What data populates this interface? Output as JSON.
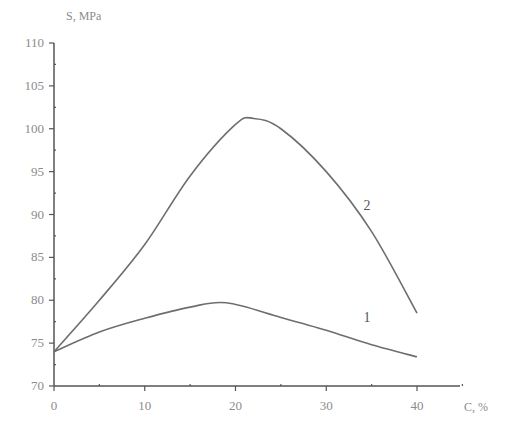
{
  "chart_data": {
    "type": "line",
    "title": "",
    "xlabel": "C, %",
    "ylabel": "S, MPa",
    "xlim": [
      0,
      45
    ],
    "ylim": [
      70,
      110
    ],
    "grid": false,
    "legend": "inline curve labels",
    "x_ticks": [
      0,
      10,
      20,
      30,
      40
    ],
    "y_ticks": [
      70,
      75,
      80,
      85,
      90,
      95,
      100,
      105,
      110
    ],
    "series": [
      {
        "name": "1",
        "x": [
          0,
          5,
          10,
          15,
          19,
          25,
          30,
          35,
          40
        ],
        "values": [
          74.0,
          76.3,
          77.9,
          79.2,
          79.7,
          78.0,
          76.5,
          74.8,
          73.4
        ]
      },
      {
        "name": "2",
        "x": [
          0,
          5,
          10,
          15,
          20,
          22,
          25,
          30,
          35,
          40
        ],
        "values": [
          74.0,
          80.0,
          86.5,
          94.5,
          100.5,
          101.2,
          100.0,
          95.0,
          88.0,
          78.5
        ]
      }
    ],
    "annotations": [
      {
        "text": "1",
        "x": 34.5,
        "y": 77.5
      },
      {
        "text": "2",
        "x": 34.5,
        "y": 90.5
      }
    ]
  },
  "axes": {
    "x_title": "C, %",
    "y_title": "S, MPa",
    "x_tick_labels": [
      "0",
      "10",
      "20",
      "30",
      "40"
    ],
    "y_tick_labels": [
      "70",
      "75",
      "80",
      "85",
      "90",
      "95",
      "100",
      "105",
      "110"
    ]
  },
  "colors": {
    "axis": "#555555",
    "curve": "#6e6e6e",
    "text": "#8c8c8c"
  }
}
